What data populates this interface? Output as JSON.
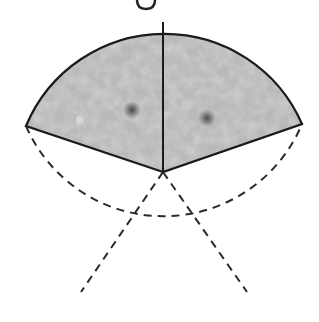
{
  "diagram": {
    "center": [
      163,
      172
    ],
    "radius": 150,
    "sector_count": 5,
    "filled_sectors": 2,
    "empty_sectors": 3,
    "colors": {
      "fill": "#b8b8b8",
      "outline": "#1a1a1a",
      "spot": "#555555"
    },
    "top_glyph": "g"
  }
}
